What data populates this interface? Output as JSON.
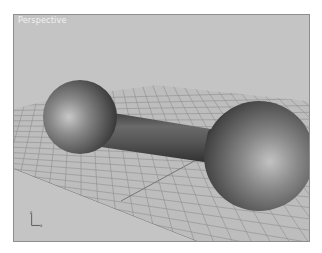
{
  "viewport": {
    "label": "Perspective",
    "background_color": "#c4c4c4",
    "border_color": "#8e8e8e"
  },
  "scene": {
    "objects": [
      {
        "name": "dumbbell",
        "parts": [
          "left-sphere",
          "handle-cylinder",
          "right-sphere"
        ]
      },
      {
        "name": "ground-grid"
      }
    ]
  },
  "axis_tripod": {
    "z_label": "z",
    "x_label": "x"
  }
}
